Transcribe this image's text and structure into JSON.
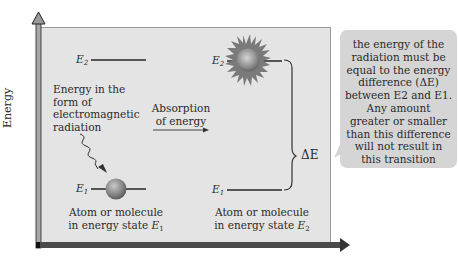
{
  "axis": {
    "y_label": "Energy",
    "colors": {
      "axis_fill": "#a8a8a8",
      "axis_outline": "#222222",
      "bottom_axis": "#4a4a4a"
    }
  },
  "panel": {
    "background": "#e4e4e4"
  },
  "left_state": {
    "e2_label": "E",
    "e2_sub": "2",
    "e1_label": "E",
    "e1_sub": "1",
    "radiation_text": [
      "Energy in the",
      "form of",
      "electromagnetic",
      "radiation"
    ],
    "caption_line1": "Atom or molecule",
    "caption_line2": "in energy state ",
    "caption_state": "E",
    "caption_sub": "1"
  },
  "transition": {
    "label_line1": "Absorption",
    "label_line2": "of energy"
  },
  "right_state": {
    "e2_label": "E",
    "e2_sub": "2",
    "e1_label": "E",
    "e1_sub": "1",
    "caption_line1": "Atom or molecule",
    "caption_line2": "in energy state ",
    "caption_state": "E",
    "caption_sub": "2"
  },
  "delta": {
    "label": "ΔE"
  },
  "callout": {
    "background": "#d5d5d5",
    "lines": [
      "the energy of the",
      "radiation must be",
      "equal to the energy",
      "difference (ΔE)",
      "between E2 and E1.",
      "Any amount",
      "greater or smaller",
      "than this difference",
      "will not result in",
      "this transition"
    ]
  }
}
